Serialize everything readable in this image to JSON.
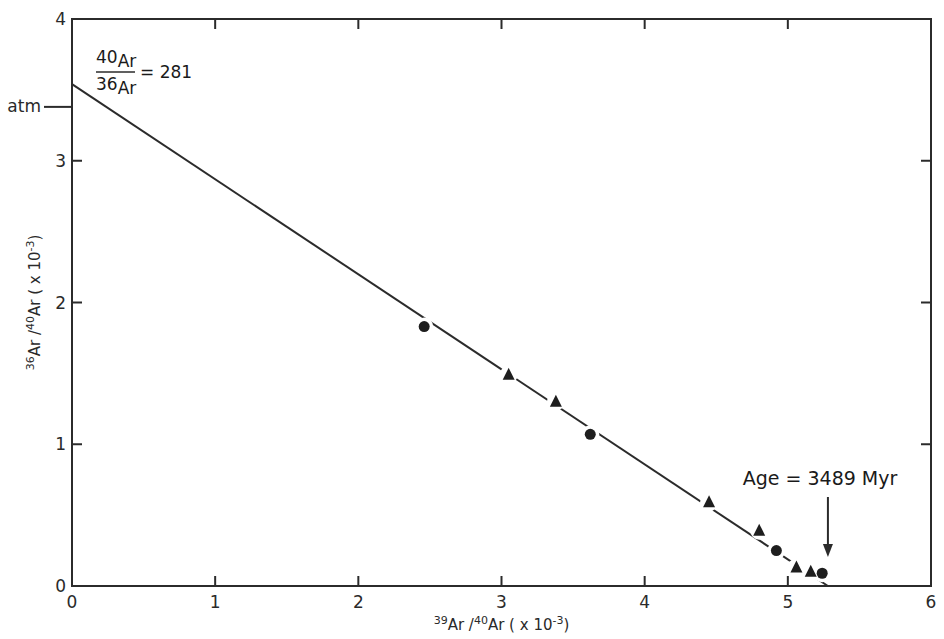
{
  "chart_data": {
    "type": "scatter",
    "title": "",
    "xlabel": "39Ar/40Ar (x10-3)",
    "ylabel": "36Ar/40Ar (x10-3)",
    "xlabel_parts": {
      "sup1": "39",
      "t1": "Ar /",
      "sup2": "40",
      "t2": "Ar ( x 10",
      "sup3": "-3",
      "t3": ")"
    },
    "ylabel_parts": {
      "sup1": "36",
      "t1": "Ar /",
      "sup2": "40",
      "t2": "Ar ( x 10",
      "sup3": "-3",
      "t3": ")"
    },
    "xlim": [
      0,
      6
    ],
    "ylim": [
      0,
      4
    ],
    "x_ticks": [
      "0",
      "1",
      "2",
      "3",
      "4",
      "5",
      "6"
    ],
    "y_ticks": [
      "0",
      "1",
      "2",
      "3",
      "4"
    ],
    "grid": false,
    "series": [
      {
        "name": "circles",
        "marker": "circle",
        "points": [
          [
            2.46,
            1.83
          ],
          [
            3.62,
            1.07
          ],
          [
            4.92,
            0.25
          ],
          [
            5.24,
            0.09
          ]
        ]
      },
      {
        "name": "triangles",
        "marker": "triangle",
        "points": [
          [
            3.05,
            1.49
          ],
          [
            3.38,
            1.3
          ],
          [
            4.45,
            0.59
          ],
          [
            4.8,
            0.39
          ],
          [
            5.06,
            0.13
          ],
          [
            5.16,
            0.1
          ]
        ]
      }
    ],
    "fit_line": {
      "x0": 0,
      "y0": 3.54,
      "x1": 5.28,
      "y1": 0
    },
    "annotations": {
      "atm_label": "atm",
      "atm_y": 3.38,
      "ratio_numerator_sup": "40",
      "ratio_numerator": "Ar",
      "ratio_denominator_sup": "36",
      "ratio_denominator": "Ar",
      "ratio_value": "= 281",
      "age_label": "Age = 3489 Myr",
      "age_arrow_x": 5.28
    }
  }
}
